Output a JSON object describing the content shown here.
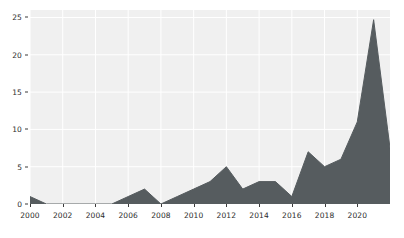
{
  "chart_data": {
    "type": "area",
    "title": "",
    "subtitle": "",
    "xlabel": "",
    "ylabel": "",
    "xlim": [
      2000,
      2022
    ],
    "ylim": [
      0,
      26
    ],
    "grid": true,
    "legend": null,
    "series_color": "#565c5f",
    "plot_background": "#f0f0f0",
    "grid_color": "#ffffff",
    "x": [
      2000,
      2001,
      2002,
      2003,
      2004,
      2005,
      2006,
      2007,
      2008,
      2009,
      2010,
      2011,
      2012,
      2013,
      2014,
      2015,
      2016,
      2017,
      2018,
      2019,
      2020,
      2021,
      2022
    ],
    "values": [
      1.0,
      0.0,
      0.0,
      0.0,
      0.0,
      0.0,
      1.0,
      2.0,
      0.0,
      1.0,
      2.0,
      3.0,
      5.0,
      2.0,
      3.0,
      3.0,
      1.0,
      7.0,
      5.0,
      6.0,
      11.0,
      24.7,
      7.5
    ],
    "series": [
      {
        "name": "count",
        "values": [
          1.0,
          0.0,
          0.0,
          0.0,
          0.0,
          0.0,
          1.0,
          2.0,
          0.0,
          1.0,
          2.0,
          3.0,
          5.0,
          2.0,
          3.0,
          3.0,
          1.0,
          7.0,
          5.0,
          6.0,
          11.0,
          24.7,
          7.5
        ]
      }
    ],
    "x_ticks": [
      2000,
      2002,
      2004,
      2006,
      2008,
      2010,
      2012,
      2014,
      2016,
      2018,
      2020
    ],
    "x_tick_labels": [
      "2000",
      "2002",
      "2004",
      "2006",
      "2008",
      "2010",
      "2012",
      "2014",
      "2016",
      "2018",
      "2020"
    ],
    "y_ticks": [
      0,
      5,
      10,
      15,
      20,
      25
    ],
    "y_tick_labels": [
      "0",
      "5",
      "10",
      "15",
      "20",
      "25"
    ]
  }
}
